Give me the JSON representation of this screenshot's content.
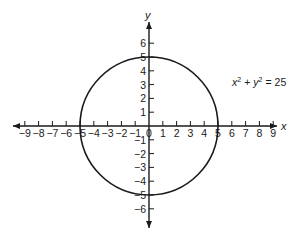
{
  "chart_data": {
    "type": "diagram",
    "title": "",
    "equation": "x² + y² = 25",
    "equation_parts": {
      "x": "x",
      "sup1": "2",
      "plus": "+",
      "y": "y",
      "sup2": "2",
      "eq": "=",
      "rhs": "25"
    },
    "shape": {
      "kind": "circle",
      "center": [
        0,
        0
      ],
      "radius": 5
    },
    "xlabel": "x",
    "ylabel": "y",
    "x_ticks": [
      -9,
      -8,
      -7,
      -6,
      -5,
      -4,
      -3,
      -2,
      -1,
      0,
      1,
      2,
      3,
      4,
      5,
      6,
      7,
      8,
      9
    ],
    "y_ticks": [
      -6,
      -5,
      -4,
      -3,
      -2,
      -1,
      1,
      2,
      3,
      4,
      5,
      6
    ],
    "x_tick_labels": [
      "−9",
      "−8",
      "−7",
      "−6",
      "−5",
      "−4",
      "−3",
      "−2",
      "−1",
      "0",
      "1",
      "2",
      "3",
      "4",
      "5",
      "6",
      "7",
      "8",
      "9"
    ],
    "y_tick_labels": [
      "−6",
      "−5",
      "−4",
      "−3",
      "−2",
      "−1",
      "1",
      "2",
      "3",
      "4",
      "5",
      "6"
    ],
    "xlim": [
      -9.8,
      9.3
    ],
    "ylim": [
      -7.4,
      7.5
    ],
    "grid": false
  },
  "colors": {
    "ink": "#1a1a1a",
    "background": "#ffffff"
  }
}
